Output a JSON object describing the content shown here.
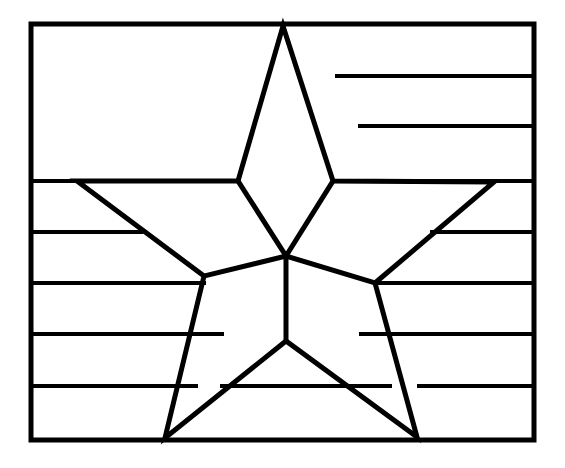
{
  "document": {
    "title": "Flag With Star Coloring Page",
    "type": "line-art-coloring-page",
    "alt_text": "Black outline drawing of a rectangular flag filled with horizontal stripes and one large five-pointed star overlaid in the center"
  },
  "canvas": {
    "width": 565,
    "height": 468,
    "background_color": "#ffffff",
    "ink_color": "#000000"
  },
  "drawing": {
    "frame": {
      "name": "flag-rectangle",
      "x": 31,
      "y": 24,
      "width": 503,
      "height": 416,
      "stroke_width": 5
    },
    "stripes": {
      "count": 7,
      "stroke_width": 4,
      "segments": [
        {
          "id": "stripe-1-right",
          "x1": 337,
          "y1": 76,
          "x2": 534,
          "y2": 76
        },
        {
          "id": "stripe-2-right",
          "x1": 360,
          "y1": 126,
          "x2": 534,
          "y2": 126
        },
        {
          "id": "stripe-3-left",
          "x1": 31,
          "y1": 181,
          "x2": 238,
          "y2": 181
        },
        {
          "id": "stripe-3-right",
          "x1": 333,
          "y1": 181,
          "x2": 534,
          "y2": 181
        },
        {
          "id": "stripe-4-left",
          "x1": 31,
          "y1": 232,
          "x2": 141,
          "y2": 232
        },
        {
          "id": "stripe-4-right",
          "x1": 432,
          "y1": 232,
          "x2": 534,
          "y2": 232
        },
        {
          "id": "stripe-5-left",
          "x1": 31,
          "y1": 283,
          "x2": 204,
          "y2": 283
        },
        {
          "id": "stripe-5-right",
          "x1": 375,
          "y1": 283,
          "x2": 534,
          "y2": 283
        },
        {
          "id": "stripe-6-left",
          "x1": 31,
          "y1": 334,
          "x2": 222,
          "y2": 334
        },
        {
          "id": "stripe-6-right",
          "x1": 361,
          "y1": 334,
          "x2": 534,
          "y2": 334
        },
        {
          "id": "stripe-7-left",
          "x1": 31,
          "y1": 386,
          "x2": 196,
          "y2": 386
        },
        {
          "id": "stripe-7-mid",
          "x1": 222,
          "y1": 386,
          "x2": 390,
          "y2": 386
        },
        {
          "id": "stripe-7-right",
          "x1": 419,
          "y1": 386,
          "x2": 534,
          "y2": 386
        }
      ]
    },
    "star": {
      "name": "five-pointed-star",
      "stroke_width": 5,
      "outline_points": "283,26 333,181 494,182 375,283 417,437 286,341 165,438 204,276 77,181 238,181",
      "vertices": [
        {
          "id": "tip-top",
          "x": 283,
          "y": 26,
          "kind": "outer"
        },
        {
          "id": "notch-upper-right",
          "x": 333,
          "y": 181,
          "kind": "inner"
        },
        {
          "id": "tip-right",
          "x": 494,
          "y": 182,
          "kind": "outer"
        },
        {
          "id": "notch-lower-right",
          "x": 375,
          "y": 283,
          "kind": "inner"
        },
        {
          "id": "tip-bottom-right",
          "x": 417,
          "y": 437,
          "kind": "outer"
        },
        {
          "id": "notch-bottom",
          "x": 286,
          "y": 341,
          "kind": "inner"
        },
        {
          "id": "tip-bottom-left",
          "x": 165,
          "y": 438,
          "kind": "outer"
        },
        {
          "id": "notch-lower-left",
          "x": 204,
          "y": 276,
          "kind": "inner"
        },
        {
          "id": "tip-left",
          "x": 77,
          "y": 181,
          "kind": "outer"
        },
        {
          "id": "notch-upper-left",
          "x": 238,
          "y": 181,
          "kind": "inner"
        }
      ],
      "center_hub": {
        "x": 286,
        "y": 256
      },
      "spokes": [
        {
          "id": "spoke-to-upper-left-notch",
          "x1": 286,
          "y1": 256,
          "x2": 238,
          "y2": 181
        },
        {
          "id": "spoke-to-upper-right-notch",
          "x1": 286,
          "y1": 256,
          "x2": 333,
          "y2": 181
        },
        {
          "id": "spoke-to-lower-right-notch",
          "x1": 286,
          "y1": 256,
          "x2": 375,
          "y2": 283
        },
        {
          "id": "spoke-to-bottom-notch",
          "x1": 286,
          "y1": 256,
          "x2": 286,
          "y2": 341
        },
        {
          "id": "spoke-to-lower-left-notch",
          "x1": 286,
          "y1": 256,
          "x2": 204,
          "y2": 276
        }
      ]
    }
  }
}
